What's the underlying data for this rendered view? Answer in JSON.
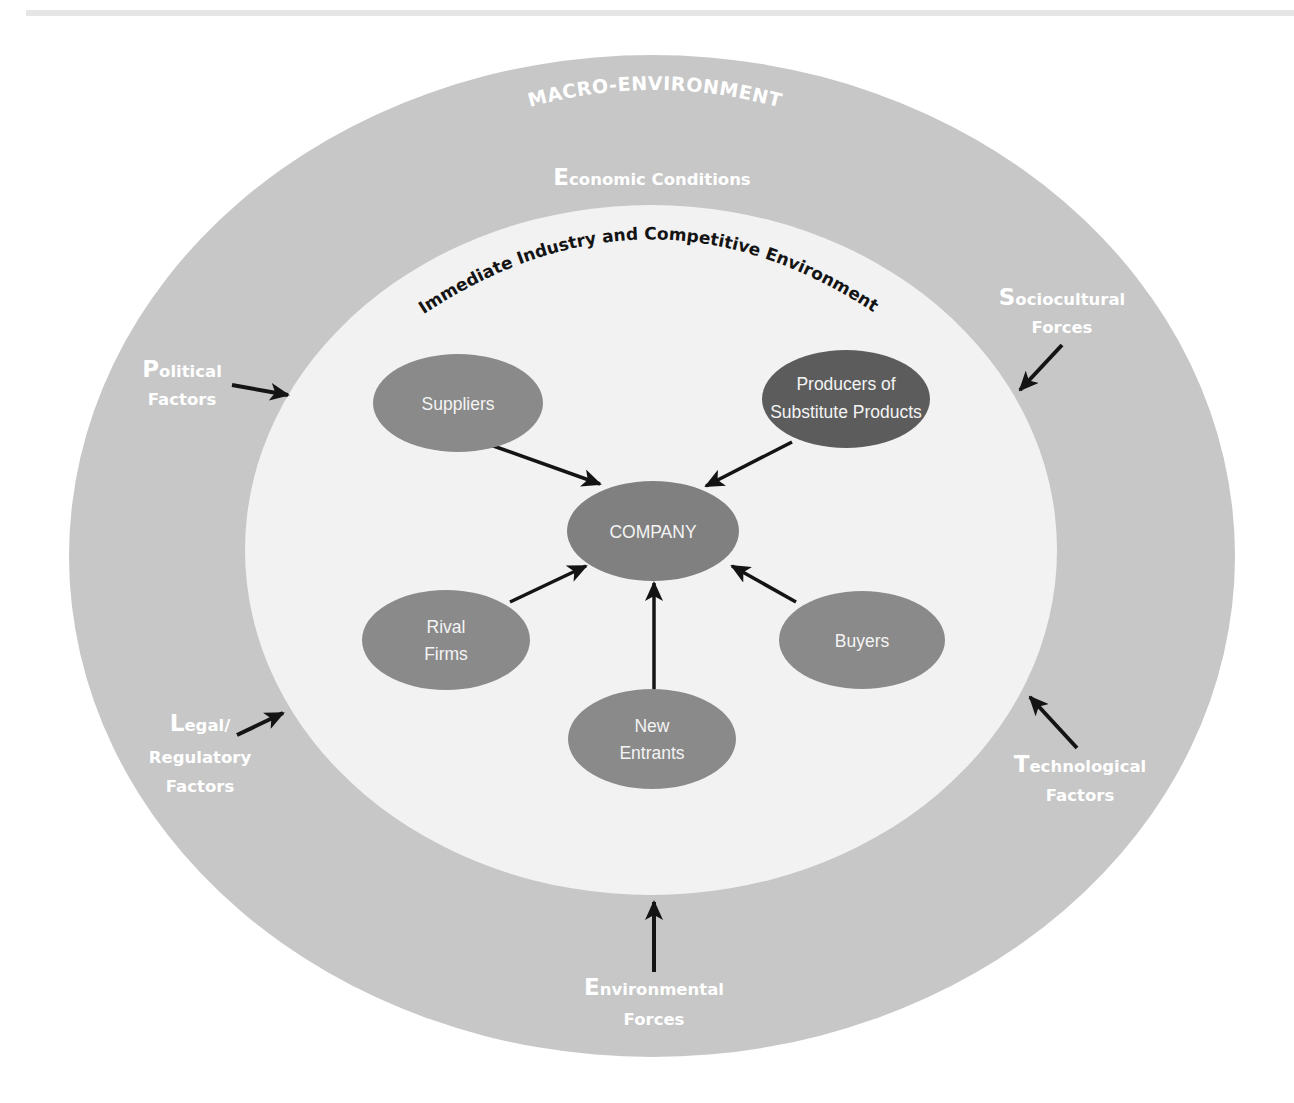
{
  "colors": {
    "background": "#ffffff",
    "macro_ring": "#c7c7c7",
    "industry_circle": "#f2f2f2",
    "node_fill": "#8a8a8a",
    "node_dark_fill": "#5c5c5c",
    "node_text": "#f4f4f4",
    "arrow": "#141414",
    "factor_text": "#ffffff"
  },
  "macro_environment": {
    "title": "MACRO-ENVIRONMENT"
  },
  "industry_environment": {
    "title": "Immediate Industry and Competitive Environment"
  },
  "macro_factors": {
    "economic": {
      "initial": "E",
      "line1_rest": "conomic Conditions"
    },
    "political": {
      "initial": "P",
      "line1_rest": "olitical",
      "line2": "Factors"
    },
    "sociocultural": {
      "initial": "S",
      "line1_rest": "ociocultural",
      "line2": "Forces"
    },
    "legal": {
      "initial": "L",
      "line1_rest": "egal/",
      "line2": "Regulatory",
      "line3": "Factors"
    },
    "technological": {
      "initial": "T",
      "line1_rest": "echnological",
      "line2": "Factors"
    },
    "environmental": {
      "initial": "E",
      "line1_rest": "nvironmental",
      "line2": "Forces"
    }
  },
  "nodes": {
    "company": {
      "line1": "COMPANY"
    },
    "suppliers": {
      "line1": "Suppliers"
    },
    "substitutes": {
      "line1": "Producers of",
      "line2": "Substitute Products"
    },
    "rivals": {
      "line1": "Rival",
      "line2": "Firms"
    },
    "buyers": {
      "line1": "Buyers"
    },
    "new_entrants": {
      "line1": "New",
      "line2": "Entrants"
    }
  }
}
